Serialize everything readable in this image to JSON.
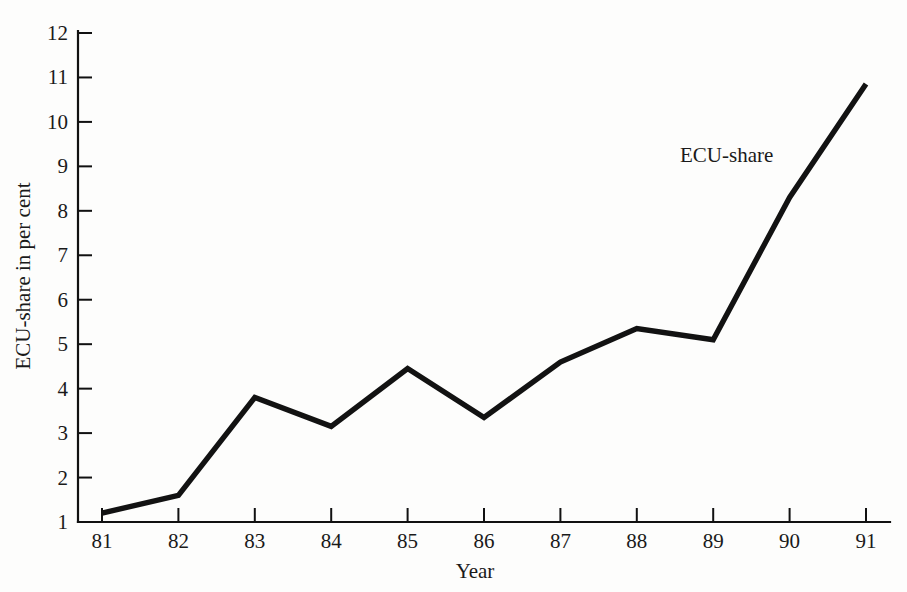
{
  "chart_data": {
    "type": "line",
    "title": "",
    "xlabel": "Year",
    "ylabel": "ECU-share in per cent",
    "x": [
      "81",
      "82",
      "83",
      "84",
      "85",
      "86",
      "87",
      "88",
      "89",
      "90",
      "91"
    ],
    "categories": [
      "81",
      "82",
      "83",
      "84",
      "85",
      "86",
      "87",
      "88",
      "89",
      "90",
      "91"
    ],
    "series": [
      {
        "name": "ECU-share",
        "values": [
          1.2,
          1.6,
          3.8,
          3.15,
          4.45,
          3.35,
          4.6,
          5.35,
          5.1,
          8.3,
          10.85
        ]
      }
    ],
    "values": [
      1.2,
      1.6,
      3.8,
      3.15,
      4.45,
      3.35,
      4.6,
      5.35,
      5.1,
      8.3,
      10.85
    ],
    "ylim": [
      1,
      12
    ],
    "yticks": [
      1,
      2,
      3,
      4,
      5,
      6,
      7,
      8,
      9,
      10,
      11,
      12
    ],
    "ytick_labels": [
      "1",
      "2",
      "3",
      "4",
      "5",
      "6",
      "7",
      "8",
      "9",
      "10",
      "11",
      "12"
    ],
    "xtick_labels": [
      "81",
      "82",
      "83",
      "84",
      "85",
      "86",
      "87",
      "88",
      "89",
      "90",
      "91"
    ],
    "grid": false,
    "legend_position": "inline-annotation",
    "annotations": [
      {
        "text": "ECU-share",
        "x_px": 680,
        "y_px": 162
      }
    ],
    "line_color": "#121212",
    "axis_color": "#111111",
    "background_color": "#fdfdfc"
  }
}
